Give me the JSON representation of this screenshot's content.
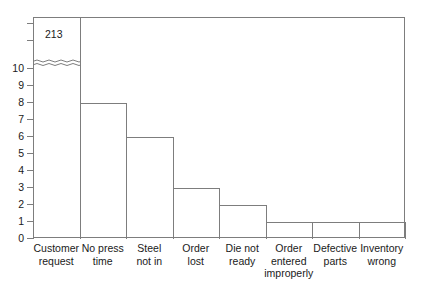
{
  "chart_data": {
    "type": "bar",
    "title": "",
    "xlabel": "",
    "ylabel": "",
    "ylim": [
      0,
      11
    ],
    "grid": false,
    "legend": null,
    "axis_break": {
      "present": true,
      "below": 10.3,
      "note": "wavy break just above the 10 tick; first bar continues to top of frame"
    },
    "y_ticks": [
      {
        "value": 0,
        "label": "0"
      },
      {
        "value": 1,
        "label": "1"
      },
      {
        "value": 2,
        "label": "2"
      },
      {
        "value": 3,
        "label": "3"
      },
      {
        "value": 4,
        "label": "4"
      },
      {
        "value": 5,
        "label": "5"
      },
      {
        "value": 6,
        "label": "6"
      },
      {
        "value": 7,
        "label": "7"
      },
      {
        "value": 8,
        "label": "8"
      },
      {
        "value": 9,
        "label": "9"
      },
      {
        "value": 10,
        "label": "10"
      },
      {
        "value": 11.6,
        "label": ""
      },
      {
        "value": 12.6,
        "label": ""
      }
    ],
    "categories": [
      "Customer request",
      "No press time",
      "Steel not in",
      "Order lost",
      "Die not ready",
      "Order entered improperly",
      "Defective parts",
      "Inventory wrong"
    ],
    "category_lines": [
      [
        "Customer",
        "request"
      ],
      [
        "No press",
        "time"
      ],
      [
        "Steel",
        "not in"
      ],
      [
        "Order",
        "lost"
      ],
      [
        "Die not",
        "ready"
      ],
      [
        "Order",
        "entered",
        "improperly"
      ],
      [
        "Defective",
        "parts"
      ],
      [
        "Inventory",
        "wrong"
      ]
    ],
    "values": [
      213,
      8,
      6,
      3,
      2,
      1,
      1,
      1
    ],
    "data_labels": [
      "213",
      "",
      "",
      "",
      "",
      "",
      "",
      ""
    ]
  },
  "style": {
    "line_color": "#7d7d7d",
    "text_color": "#1a1a1a",
    "background": "#ffffff"
  }
}
